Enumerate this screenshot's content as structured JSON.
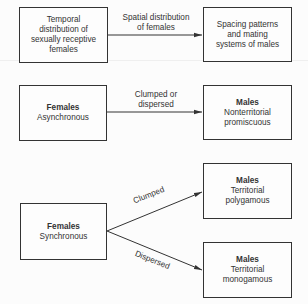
{
  "row1": {
    "left_box": [
      "Temporal",
      "distribution of",
      "sexually receptive",
      "females"
    ],
    "arrow_label": [
      "Spatial distribution",
      "of females"
    ],
    "right_box": [
      "Spacing patterns",
      "and mating",
      "systems of males"
    ]
  },
  "row2": {
    "left_box": {
      "title": "Females",
      "sub": [
        "Asynchronous"
      ]
    },
    "arrow_label": [
      "Clumped or",
      "dispersed"
    ],
    "right_box": {
      "title": "Males",
      "sub": [
        "Nonterritorial",
        "promiscuous"
      ]
    }
  },
  "row3": {
    "left_box": {
      "title": "Females",
      "sub": [
        "Synchronous"
      ]
    },
    "upper_arrow_label": "Clumped",
    "lower_arrow_label": "Dispersed",
    "upper_right_box": {
      "title": "Males",
      "sub": [
        "Territorial",
        "polygamous"
      ]
    },
    "lower_right_box": {
      "title": "Males",
      "sub": [
        "Territorial",
        "monogamous"
      ]
    }
  }
}
